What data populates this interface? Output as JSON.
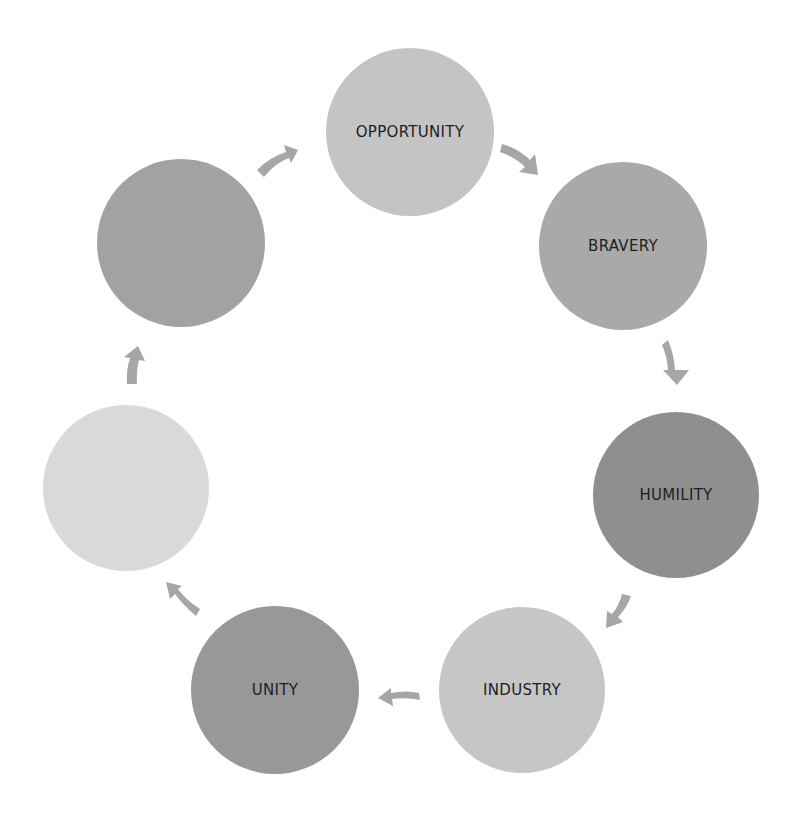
{
  "diagram": {
    "type": "cycle",
    "nodes": [
      {
        "id": "opportunity",
        "label": "OPPORTUNITY",
        "cx": 410,
        "cy": 132,
        "r": 84,
        "color": "#c4c4c4"
      },
      {
        "id": "bravery",
        "label": "BRAVERY",
        "cx": 623,
        "cy": 246,
        "r": 84,
        "color": "#a9a9a9"
      },
      {
        "id": "humility",
        "label": "HUMILITY",
        "cx": 676,
        "cy": 495,
        "r": 83,
        "color": "#8f8f8f"
      },
      {
        "id": "industry",
        "label": "INDUSTRY",
        "cx": 522,
        "cy": 690,
        "r": 83,
        "color": "#c6c6c6"
      },
      {
        "id": "unity",
        "label": "UNITY",
        "cx": 275,
        "cy": 690,
        "r": 84,
        "color": "#989898"
      },
      {
        "id": "blank-left",
        "label": "",
        "cx": 126,
        "cy": 488,
        "r": 83,
        "color": "#d9d9d9"
      },
      {
        "id": "blank-upper-left",
        "label": "",
        "cx": 181,
        "cy": 243,
        "r": 84,
        "color": "#a2a2a2"
      }
    ],
    "arrows": [
      {
        "from": "opportunity",
        "to": "bravery",
        "color": "#a6a6a6"
      },
      {
        "from": "bravery",
        "to": "humility",
        "color": "#a6a6a6"
      },
      {
        "from": "humility",
        "to": "industry",
        "color": "#a6a6a6"
      },
      {
        "from": "industry",
        "to": "unity",
        "color": "#a6a6a6"
      },
      {
        "from": "unity",
        "to": "blank-left",
        "color": "#a6a6a6"
      },
      {
        "from": "blank-left",
        "to": "blank-upper-left",
        "color": "#a6a6a6"
      },
      {
        "from": "blank-upper-left",
        "to": "opportunity",
        "color": "#a6a6a6"
      }
    ]
  }
}
